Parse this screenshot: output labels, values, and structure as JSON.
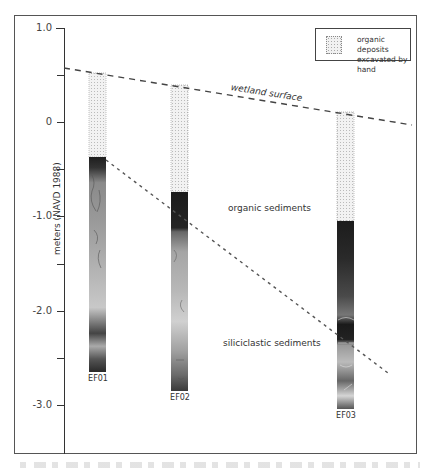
{
  "figure": {
    "y_axis": {
      "label": "meters (NAVD 1988)",
      "ticks": [
        {
          "value": "1.0",
          "y": 28
        },
        {
          "value": "",
          "y": 75
        },
        {
          "value": "0",
          "y": 122
        },
        {
          "value": "",
          "y": 169
        },
        {
          "value": "-1.0",
          "y": 216
        },
        {
          "value": "",
          "y": 264
        },
        {
          "value": "-2.0",
          "y": 311
        },
        {
          "value": "",
          "y": 358
        },
        {
          "value": "-3.0",
          "y": 405
        }
      ]
    },
    "legend": {
      "label_line1": "organic deposits",
      "label_line2": "excavated by hand"
    },
    "annotations": {
      "wetland_surface": "wetland surface",
      "organic_sediments": "organic sediments",
      "siliciclastic_sediments": "siliciclastic sediments"
    },
    "cores": [
      {
        "id": "EF01",
        "label": "EF01",
        "x": 89,
        "top": 73,
        "dark_top": 157,
        "bottom": 372
      },
      {
        "id": "EF02",
        "label": "EF02",
        "x": 171,
        "top": 85,
        "dark_top": 192,
        "bottom": 391
      },
      {
        "id": "EF03",
        "label": "EF03",
        "x": 337,
        "top": 112,
        "dark_top": 221,
        "bottom": 409
      }
    ],
    "lines": {
      "wetland_surface": {
        "x1": 64,
        "y1": 68,
        "x2": 412,
        "y2": 125
      },
      "organic_siliciclastic_contact": {
        "x1": 106,
        "y1": 160,
        "x2": 388,
        "y2": 373
      }
    }
  }
}
